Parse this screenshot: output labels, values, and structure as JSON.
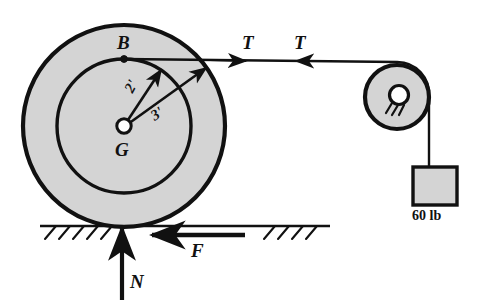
{
  "figure": {
    "type": "free-body-diagram",
    "colors": {
      "body_fill": "#d4d4d4",
      "outline": "#111111",
      "background": "#ffffff",
      "hub_fill": "#ffffff"
    }
  },
  "labels": {
    "point_B": "B",
    "center_G": "G",
    "inner_radius": "2'",
    "outer_radius": "3'",
    "tension_left": "T",
    "tension_right": "T",
    "friction": "F",
    "normal": "N",
    "block_weight": "60 lb"
  },
  "geometry": {
    "wheel": {
      "center_x": 124,
      "center_y": 126,
      "outer_radius_px": 101,
      "inner_radius_px": 67,
      "outer_radius_value": "3'",
      "inner_radius_value": "2'"
    },
    "point_B": {
      "x": 124,
      "y": 59
    },
    "pulley": {
      "center_x": 397,
      "center_y": 97,
      "radius_px": 32,
      "hub_radius_px": 10
    },
    "block": {
      "x": 413,
      "y": 167,
      "width": 44,
      "height": 38
    },
    "ground_line_y": 226,
    "cord_y": 59
  },
  "icons": {
    "pin_support": "pin-support-icon",
    "ground_hatch": "ground-hatch-icon",
    "arrow_tension": "arrow-right-icon",
    "arrow_friction": "arrow-left-icon",
    "arrow_normal": "arrow-up-icon"
  }
}
